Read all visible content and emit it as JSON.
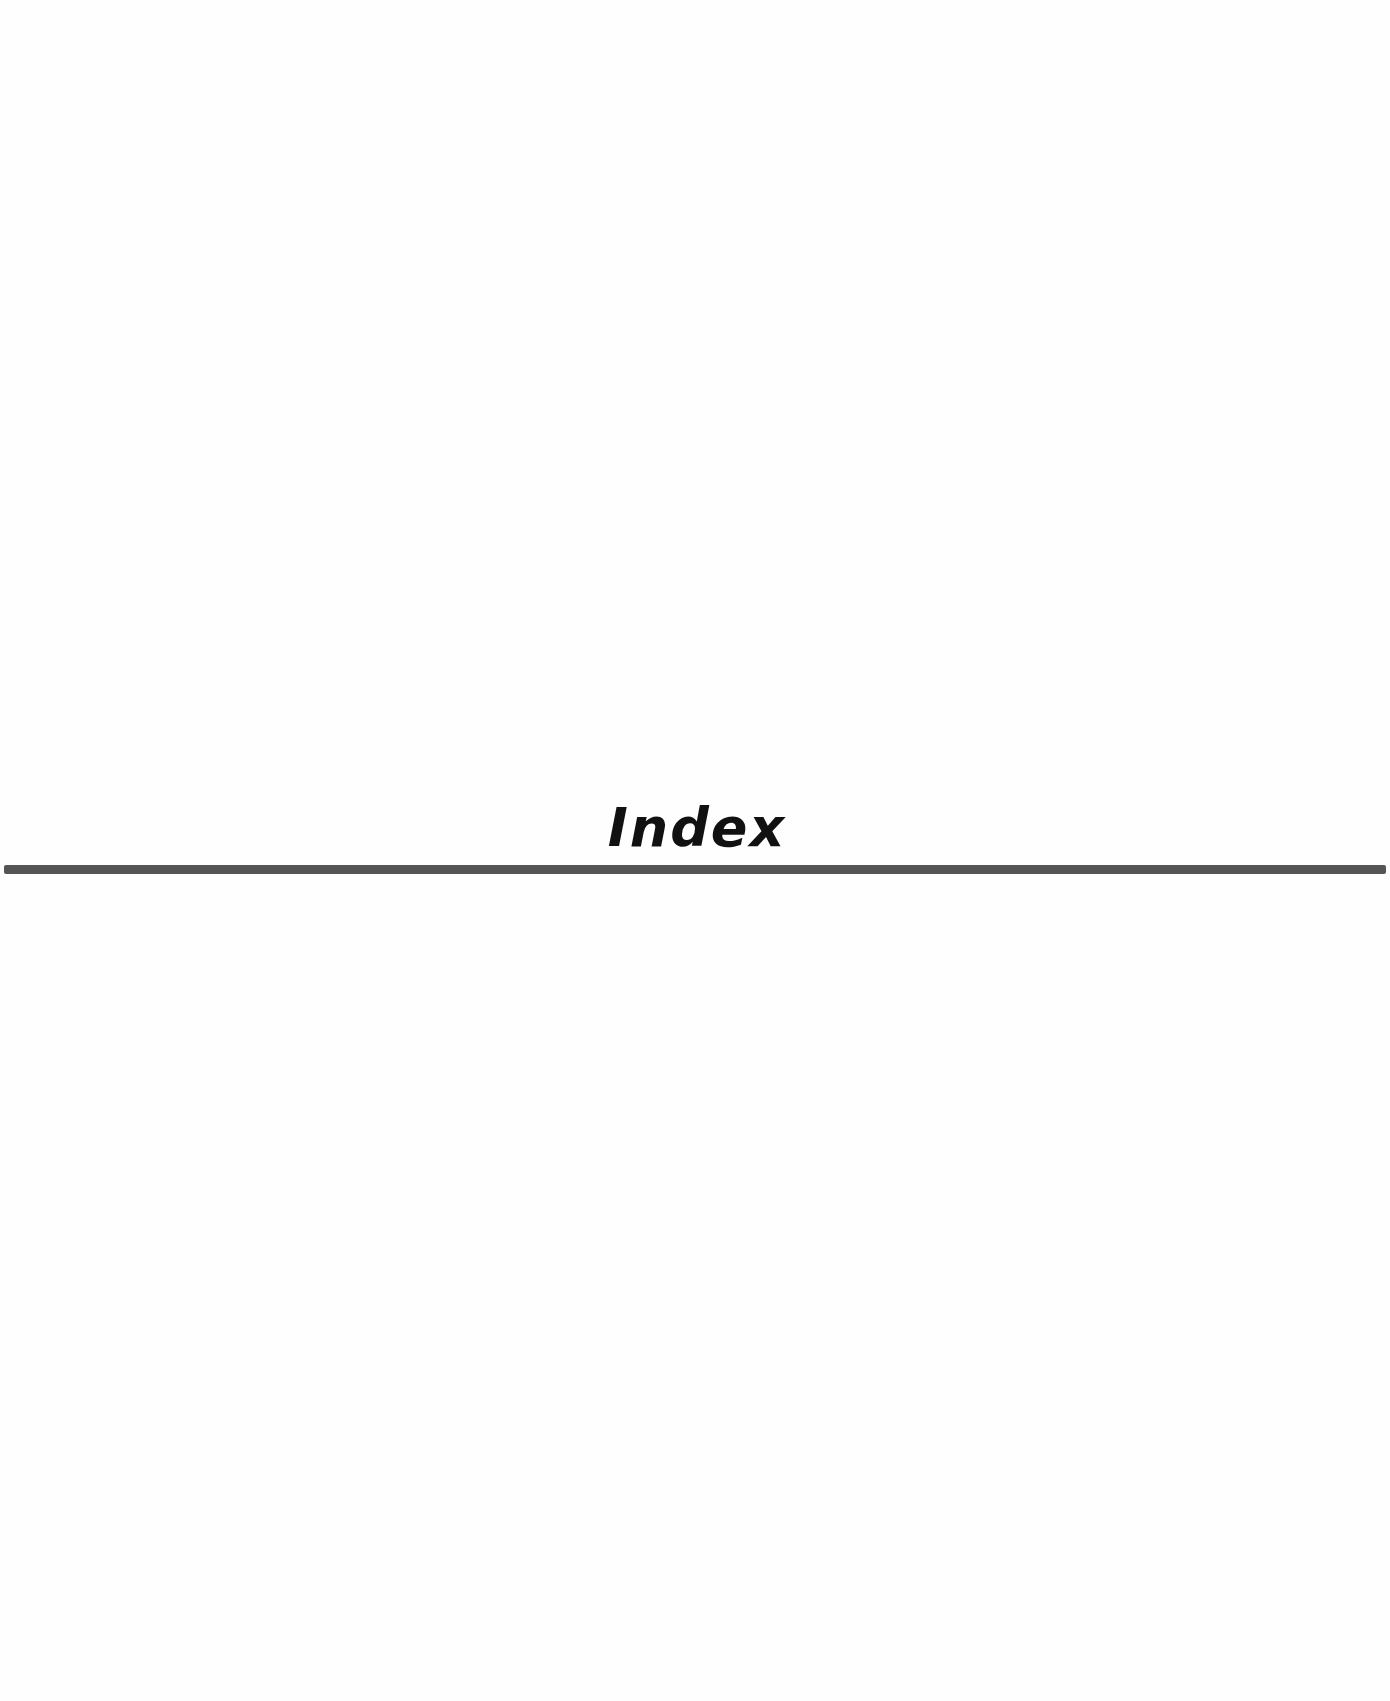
{
  "page": {
    "title": "Index",
    "rule_color": "#555555",
    "text_color": "#111111",
    "background": "#ffffff"
  }
}
